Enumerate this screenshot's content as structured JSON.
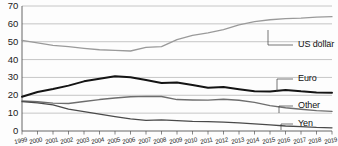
{
  "chart_data": {
    "type": "line",
    "title": "",
    "subtitle": "",
    "xlabel": "",
    "ylabel": "",
    "xlim": [
      1999,
      2019
    ],
    "ylim": [
      0,
      70
    ],
    "ytick_step": 10,
    "yticks": [
      "0",
      "10",
      "20",
      "30",
      "40",
      "50",
      "60",
      "70"
    ],
    "grid": true,
    "grid_axis": "y",
    "legend_position": "right-inline-leader-lines",
    "x": [
      1999,
      2000,
      2001,
      2002,
      2003,
      2004,
      2005,
      2006,
      2007,
      2008,
      2009,
      2010,
      2011,
      2012,
      2013,
      2014,
      2015,
      2016,
      2017,
      2018,
      2019
    ],
    "categories": [
      "1999",
      "2000",
      "2001",
      "2002",
      "2003",
      "2004",
      "2005",
      "2006",
      "2007",
      "2008",
      "2009",
      "2010",
      "2011",
      "2012",
      "2013",
      "2014",
      "2015",
      "2016",
      "2017",
      "2018",
      "2019"
    ],
    "series": [
      {
        "name": "US dollar",
        "color": "#9a9a9a",
        "width": 1.3,
        "values": [
          50.8,
          49.3,
          48.0,
          47.2,
          46.3,
          45.5,
          45.2,
          44.8,
          46.8,
          47.2,
          51.2,
          53.6,
          55.0,
          56.8,
          59.4,
          61.2,
          62.3,
          62.9,
          63.2,
          63.8,
          64.0
        ]
      },
      {
        "name": "Euro",
        "color": "#141414",
        "width": 2.0,
        "values": [
          19.2,
          21.8,
          23.5,
          25.4,
          27.8,
          29.2,
          30.6,
          30.1,
          28.6,
          26.9,
          27.2,
          25.8,
          24.2,
          24.6,
          23.4,
          22.3,
          22.1,
          23.0,
          22.2,
          21.6,
          21.4
        ]
      },
      {
        "name": "Other",
        "color": "#6e6e6e",
        "width": 1.4,
        "values": [
          16.8,
          16.4,
          15.6,
          15.4,
          16.5,
          17.6,
          18.5,
          19.2,
          19.4,
          19.3,
          17.6,
          17.4,
          17.3,
          17.8,
          17.2,
          16.0,
          14.2,
          13.0,
          12.2,
          11.4,
          11.0
        ]
      },
      {
        "name": "Yen",
        "color": "#4a4a4a",
        "width": 1.3,
        "values": [
          16.4,
          15.8,
          14.6,
          12.2,
          10.8,
          9.4,
          8.0,
          6.8,
          6.0,
          6.2,
          5.8,
          5.4,
          5.2,
          5.0,
          4.6,
          4.0,
          3.4,
          2.8,
          2.4,
          2.0,
          1.8
        ]
      }
    ],
    "annotations": [
      {
        "name": "US dollar",
        "label_x": 298,
        "label_y": 45,
        "anchor_x": 268,
        "anchor_y": 30
      },
      {
        "name": "Euro",
        "label_x": 298,
        "label_y": 79,
        "anchor_x": 277,
        "anchor_y": 92
      },
      {
        "name": "Other",
        "label_x": 298,
        "label_y": 106,
        "anchor_x": 279,
        "anchor_y": 113
      },
      {
        "name": "Yen",
        "label_x": 298,
        "label_y": 124,
        "anchor_x": 281,
        "anchor_y": 130
      }
    ]
  },
  "axes": {
    "y_labels": [
      "70",
      "60",
      "50",
      "40",
      "30",
      "20",
      "10",
      "0"
    ],
    "x_labels": [
      "1999",
      "2000",
      "2001",
      "2002",
      "2003",
      "2004",
      "2005",
      "2006",
      "2007",
      "2008",
      "2009",
      "2010",
      "2011",
      "2012",
      "2013",
      "2014",
      "2015",
      "2016",
      "2017",
      "2018",
      "2019"
    ]
  },
  "labels": {
    "usd": "US dollar",
    "euro": "Euro",
    "other": "Other",
    "yen": "Yen"
  },
  "colors": {
    "usd": "#9a9a9a",
    "euro": "#141414",
    "other": "#6e6e6e",
    "yen": "#4a4a4a",
    "grid": "#b8b8b8",
    "axis": "#555555",
    "text": "#1a1a1a",
    "background": "#fdfdfd"
  }
}
